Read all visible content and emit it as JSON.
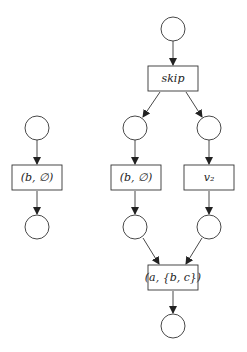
{
  "diagram": {
    "type": "petri-net",
    "places": [
      {
        "id": "p_top",
        "cx": 173,
        "cy": 29
      },
      {
        "id": "p_skip_left",
        "cx": 135,
        "cy": 128
      },
      {
        "id": "p_skip_right",
        "cx": 209,
        "cy": 128
      },
      {
        "id": "p_left_in",
        "cx": 37,
        "cy": 128
      },
      {
        "id": "p_left_out",
        "cx": 37,
        "cy": 227
      },
      {
        "id": "p_mid_out",
        "cx": 135,
        "cy": 227
      },
      {
        "id": "p_right_out",
        "cx": 209,
        "cy": 227
      },
      {
        "id": "p_bottom",
        "cx": 173,
        "cy": 326
      }
    ],
    "transitions": [
      {
        "id": "t_skip",
        "label": "skip"
      },
      {
        "id": "t_left",
        "label": "(b, ∅)"
      },
      {
        "id": "t_mid",
        "label": "(b, ∅)"
      },
      {
        "id": "t_v2",
        "label": "v₂"
      },
      {
        "id": "t_join",
        "label": "(a, {b, c})"
      }
    ]
  }
}
